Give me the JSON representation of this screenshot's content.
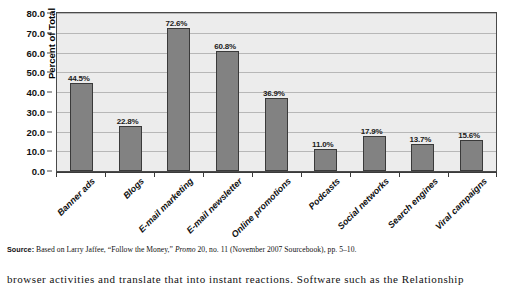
{
  "chart_data": {
    "type": "bar",
    "title": "",
    "xlabel": "",
    "ylabel": "Percent of Total",
    "ylim": [
      0,
      80
    ],
    "ytick_step": 10,
    "grid": true,
    "legend": "none",
    "bar_color": "#828282",
    "plot_background": "#ececec",
    "categories": [
      "Banner ads",
      "Blogs",
      "E-mail marketing",
      "E-mail newsletter",
      "Online promotions",
      "Podcasts",
      "Social networks",
      "Search engines",
      "Viral campaigns"
    ],
    "values": [
      44.5,
      22.8,
      72.6,
      60.8,
      36.9,
      11.0,
      17.9,
      13.7,
      15.6
    ],
    "data_labels": [
      "44.5%",
      "22.8%",
      "72.6%",
      "60.8%",
      "36.9%",
      "11.0%",
      "17.9%",
      "13.7%",
      "15.6%"
    ],
    "ytick_labels": [
      "80.0",
      "70.0",
      "60.0",
      "50.0",
      "40.0",
      "30.0",
      "20.0",
      "10.0",
      "0.0"
    ]
  },
  "source_note": {
    "label": "Source:",
    "text": " Based on Larry Jaffee, “Follow the Money,” ",
    "italic_part": "Promo",
    "text_tail": " 20, no. 11 (November 2007 Sourcebook), pp. 5–10."
  },
  "body_text": {
    "line": "browser activities and translate that into instant reactions. Software such as the Relationship"
  }
}
